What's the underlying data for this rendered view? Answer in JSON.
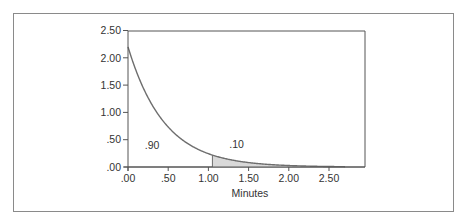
{
  "chart_data": {
    "type": "area",
    "title": "",
    "xlabel": "Minutes",
    "ylabel": "",
    "distribution": "exponential",
    "rate_lambda": 2.2,
    "xlim": [
      0,
      2.7
    ],
    "ylim": [
      0,
      2.5
    ],
    "x_ticks": [
      0,
      0.5,
      1.0,
      1.5,
      2.0,
      2.5
    ],
    "x_tick_labels": [
      ".00",
      ".50",
      "1.00",
      "1.50",
      "2.00",
      "2.50"
    ],
    "y_ticks": [
      0,
      0.5,
      1.0,
      1.5,
      2.0,
      2.5
    ],
    "y_tick_labels": [
      ".00",
      ".50",
      "1.00",
      "1.50",
      "2.00",
      "2.50"
    ],
    "series": [
      {
        "name": "density",
        "x": [
          0,
          0.25,
          0.5,
          0.75,
          1.0,
          1.25,
          1.5,
          1.75,
          2.0,
          2.25,
          2.5,
          2.7
        ],
        "values": [
          2.2,
          1.27,
          0.73,
          0.42,
          0.24,
          0.14,
          0.08,
          0.047,
          0.027,
          0.016,
          0.009,
          0.006
        ]
      }
    ],
    "shaded_region": {
      "from": 1.05,
      "to": 2.7,
      "fill": "#d9d9d9"
    },
    "annotations": [
      {
        "text": ".90",
        "x": 0.3,
        "y": 0.33,
        "meaning": "area to left of 1.05"
      },
      {
        "text": ".10",
        "x": 1.35,
        "y": 0.35,
        "meaning": "shaded area to right of 1.05"
      }
    ],
    "grid": false,
    "legend": "none"
  },
  "colors": {
    "curve": "#6e6e6e",
    "axis": "#555555",
    "frame": "#8a8a8a",
    "shade": "#d9d9d9"
  }
}
